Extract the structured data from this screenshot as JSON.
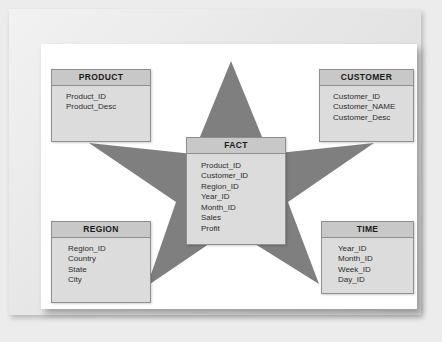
{
  "diagram": {
    "type": "star-schema",
    "title": "",
    "star_color": "#7f7f7f",
    "header_color": "#c8c8c8",
    "body_color": "#dcdcdc",
    "border_color": "#8e8e8e"
  },
  "entities": {
    "product": {
      "name": "PRODUCT",
      "fields": [
        "Product_ID",
        "Product_Desc"
      ]
    },
    "customer": {
      "name": "CUSTOMER",
      "fields": [
        "Customer_ID",
        "Customer_NAME",
        "Customer_Desc"
      ]
    },
    "fact": {
      "name": "FACT",
      "fields": [
        "Product_ID",
        "Customer_ID",
        "Region_ID",
        "Year_ID",
        "Month_ID",
        "Sales",
        "Profit"
      ]
    },
    "region": {
      "name": "REGION",
      "fields": [
        "Region_ID",
        "Country",
        "State",
        "City"
      ]
    },
    "time": {
      "name": "TIME",
      "fields": [
        "Year_ID",
        "Month_ID",
        "Week_ID",
        "Day_ID"
      ]
    }
  }
}
